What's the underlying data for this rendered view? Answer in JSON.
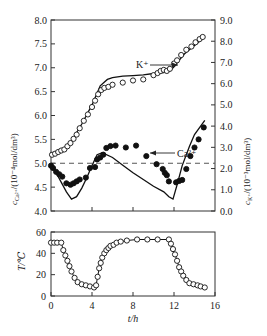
{
  "chart_data": [
    {
      "type": "line",
      "title": "",
      "xlabel": "t/h",
      "ylabel_left": "c_Ca2+/(10^-4 mol/dm^3)",
      "ylabel_right": "c_K+/(10^-3 mol/dm^3)",
      "xlim": [
        0,
        16
      ],
      "ylim_left": [
        4.0,
        8.0
      ],
      "ylim_right": [
        0.0,
        9.0
      ],
      "yticks_left": [
        "4.0",
        "4.5",
        "5.0",
        "5.5",
        "6.0",
        "6.5",
        "7.0",
        "7.5",
        "8.0"
      ],
      "yticks_right": [
        "0.0",
        "1.0",
        "2.0",
        "3.0",
        "4.0",
        "5.0",
        "6.0",
        "7.0",
        "8.0",
        "9.0"
      ],
      "grid": false,
      "reference_line": {
        "axis": "left",
        "value": 5.0,
        "style": "dashed"
      },
      "annotations": [
        {
          "text": "K⁺",
          "arrow": "right",
          "points_to": "right axis"
        },
        {
          "text": "Ca²⁺",
          "arrow": "left",
          "points_to": "left axis"
        }
      ],
      "series": [
        {
          "name": "K+ measured",
          "axis": "right",
          "marker": "open-circle",
          "x": [
            0.1,
            0.4,
            0.7,
            1.0,
            1.3,
            1.6,
            1.9,
            2.2,
            2.5,
            2.8,
            3.2,
            3.6,
            4.0,
            4.3,
            4.6,
            4.9,
            5.2,
            5.6,
            6.0,
            7.0,
            8.0,
            9.0,
            10.0,
            10.4,
            10.7,
            11.0,
            11.3,
            11.6,
            12.0,
            12.3,
            12.7,
            13.2,
            13.7,
            14.1,
            14.5,
            14.8
          ],
          "y": [
            2.65,
            2.7,
            2.78,
            2.85,
            2.9,
            3.05,
            3.2,
            3.4,
            3.6,
            3.9,
            4.25,
            4.55,
            4.9,
            5.2,
            5.5,
            5.7,
            5.8,
            5.85,
            5.95,
            6.05,
            6.15,
            6.2,
            6.4,
            6.5,
            6.6,
            6.65,
            6.6,
            6.7,
            6.95,
            7.1,
            7.35,
            7.6,
            7.75,
            7.95,
            8.1,
            8.2
          ]
        },
        {
          "name": "K+ model",
          "axis": "right",
          "style": "solid",
          "x": [
            0,
            1,
            2,
            3,
            4,
            4.8,
            5.5,
            6,
            7,
            8,
            9,
            10,
            11,
            11.6,
            12,
            12.5,
            13,
            14,
            15
          ],
          "y": [
            2.7,
            2.85,
            3.3,
            4.1,
            5.0,
            5.9,
            6.2,
            6.28,
            6.35,
            6.38,
            6.42,
            6.48,
            6.52,
            6.6,
            6.8,
            7.1,
            7.4,
            7.8,
            8.2
          ]
        },
        {
          "name": "Ca2+ measured",
          "axis": "left",
          "marker": "filled-circle",
          "x": [
            0.0,
            0.2,
            0.5,
            0.8,
            1.1,
            1.5,
            1.9,
            2.2,
            2.5,
            2.8,
            3.4,
            3.8,
            4.3,
            4.5,
            4.8,
            5.1,
            5.4,
            5.8,
            6.3,
            7.3,
            8.3,
            9.3,
            10.3,
            10.9,
            11.1,
            11.3,
            11.5,
            12.2,
            12.5,
            12.8,
            13.2,
            13.6,
            14.0,
            14.4,
            14.9
          ],
          "y": [
            4.95,
            4.9,
            4.82,
            4.77,
            4.72,
            4.58,
            4.55,
            4.58,
            4.62,
            4.66,
            4.7,
            4.9,
            4.92,
            5.08,
            5.12,
            5.18,
            5.32,
            5.36,
            5.37,
            5.33,
            5.37,
            5.15,
            4.98,
            4.88,
            4.8,
            4.75,
            4.62,
            4.6,
            4.63,
            4.65,
            4.88,
            5.15,
            5.33,
            5.5,
            5.75
          ]
        },
        {
          "name": "Ca2+ model",
          "axis": "left",
          "style": "solid",
          "x": [
            0,
            0.5,
            1,
            1.5,
            2,
            2.5,
            3,
            3.5,
            4,
            4.5,
            5,
            6,
            7,
            8,
            9,
            10,
            11,
            11.5,
            11.9,
            12.3,
            12.8,
            13.5,
            14,
            15
          ],
          "y": [
            4.95,
            4.8,
            4.6,
            4.4,
            4.25,
            4.3,
            4.48,
            4.7,
            4.95,
            5.18,
            5.22,
            5.12,
            4.96,
            4.8,
            4.66,
            4.52,
            4.4,
            4.3,
            4.25,
            4.55,
            4.95,
            5.35,
            5.6,
            5.9
          ]
        }
      ]
    },
    {
      "type": "line",
      "title": "",
      "xlabel": "t/h",
      "ylabel": "T/°C",
      "xlim": [
        0,
        16
      ],
      "ylim": [
        0,
        60
      ],
      "xticks": [
        "0",
        "4",
        "8",
        "12",
        "16"
      ],
      "yticks": [
        "0",
        "20",
        "40",
        "60"
      ],
      "grid": false,
      "series": [
        {
          "name": "Temperature",
          "marker": "open-circle",
          "style": "solid",
          "x": [
            0.0,
            0.3,
            0.6,
            1.0,
            1.2,
            1.4,
            1.6,
            1.8,
            2.0,
            2.3,
            2.6,
            3.0,
            3.4,
            3.8,
            4.2,
            4.4,
            4.55,
            4.7,
            4.85,
            5.0,
            5.2,
            5.4,
            5.6,
            5.8,
            6.1,
            6.4,
            6.8,
            7.4,
            8.4,
            9.4,
            10.4,
            11.5,
            11.7,
            11.9,
            12.1,
            12.3,
            12.5,
            12.7,
            12.9,
            13.2,
            13.5,
            13.9,
            14.3,
            14.6,
            15.0
          ],
          "y": [
            50,
            50,
            50,
            50,
            43,
            38,
            33,
            28,
            23,
            17,
            13,
            11,
            10,
            9,
            8,
            10,
            18,
            26,
            31,
            36,
            40,
            43,
            45,
            47,
            48,
            50,
            51,
            52,
            53,
            53,
            53,
            53,
            49,
            44,
            39,
            33,
            27,
            23,
            19,
            15,
            12,
            11,
            10,
            9,
            8
          ]
        }
      ]
    }
  ],
  "axes": {
    "left_label_prefix": "c",
    "left_label_sub": "Ca²⁺",
    "left_label_suffix": "/(10⁻⁴mol/dm³)",
    "right_label_prefix": "c",
    "right_label_sub": "K⁺",
    "right_label_suffix": "/(10⁻³mol/dm³)",
    "bottom_ylabel": "T/℃",
    "xlabel": "t/h",
    "k_label": "K⁺",
    "ca_label": "Ca²⁺"
  }
}
